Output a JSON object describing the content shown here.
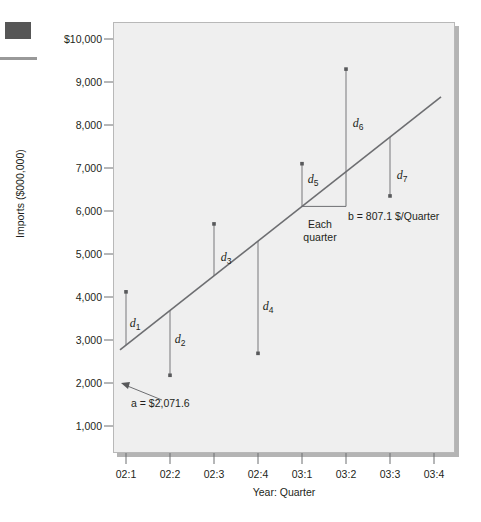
{
  "chart_data": {
    "type": "scatter",
    "title": "",
    "xlabel": "Year: Quarter",
    "ylabel": "Imports ($000,000)",
    "grid": false,
    "legend": "none",
    "categories": [
      "02:1",
      "02:2",
      "02:3",
      "02:4",
      "03:1",
      "03:2",
      "03:3",
      "03:4"
    ],
    "ytick_labels": [
      "$10,000",
      "9,000",
      "8,000",
      "7,000",
      "6,000",
      "5,000",
      "4,000",
      "3,000",
      "2,000",
      "1,000"
    ],
    "ytick_values": [
      10000,
      9000,
      8000,
      7000,
      6000,
      5000,
      4000,
      3000,
      2000,
      1000
    ],
    "ylim": [
      500,
      10500
    ],
    "xlim": [
      0.4,
      8.4
    ],
    "points": [
      {
        "x": "02:1",
        "y": 4120
      },
      {
        "x": "02:2",
        "y": 2180
      },
      {
        "x": "02:3",
        "y": 5700
      },
      {
        "x": "02:4",
        "y": 2690
      },
      {
        "x": "03:1",
        "y": 7100
      },
      {
        "x": "03:2",
        "y": 9300
      },
      {
        "x": "03:3",
        "y": 6350
      }
    ],
    "trend_line": {
      "intercept": 2071.6,
      "slope": 807.1,
      "equation": "y = 2071.6 + 807.1x"
    },
    "residual_labels": [
      "d1",
      "d2",
      "d3",
      "d4",
      "d5",
      "d6",
      "d7"
    ],
    "residual_label_display": [
      {
        "base": "d",
        "sub": "1"
      },
      {
        "base": "d",
        "sub": "2"
      },
      {
        "base": "d",
        "sub": "3"
      },
      {
        "base": "d",
        "sub": "4"
      },
      {
        "base": "d",
        "sub": "5"
      },
      {
        "base": "d",
        "sub": "6"
      },
      {
        "base": "d",
        "sub": "7"
      }
    ],
    "annotations": {
      "intercept_label": "a = $2,071.6",
      "slope_label": "b = 807.1 $/Quarter",
      "run_label_line1": "Each",
      "run_label_line2": "quarter"
    },
    "colors": {
      "plot_background": "#efefef",
      "plot_border": "#b8b8b8",
      "shadow": "#b4b4b4",
      "line": "#6d6e71",
      "point": "#58595b",
      "text": "#231f20",
      "decoration": "#565656"
    }
  },
  "ytick_positions": [
    {
      "label": "$10,000",
      "top": 39
    },
    {
      "label": "9,000",
      "top": 82
    },
    {
      "label": "8,000",
      "top": 125
    },
    {
      "label": "7,000",
      "top": 168
    },
    {
      "label": "6,000",
      "top": 211
    },
    {
      "label": "5,000",
      "top": 254
    },
    {
      "label": "4,000",
      "top": 297
    },
    {
      "label": "3,000",
      "top": 340
    },
    {
      "label": "2,000",
      "top": 383
    },
    {
      "label": "1,000",
      "top": 426
    }
  ],
  "xtick_positions": [
    {
      "label": "02:1",
      "left": 126
    },
    {
      "label": "02:2",
      "left": 170
    },
    {
      "label": "02:3",
      "left": 214
    },
    {
      "label": "02:4",
      "left": 258
    },
    {
      "label": "03:1",
      "left": 302
    },
    {
      "label": "03:2",
      "left": 346
    },
    {
      "label": "03:3",
      "left": 390
    },
    {
      "label": "03:4",
      "left": 434
    }
  ],
  "dlabel_positions": [
    {
      "base": "d",
      "sub": "1",
      "left": 135,
      "top": 324
    },
    {
      "base": "d",
      "sub": "2",
      "left": 180,
      "top": 340
    },
    {
      "base": "d",
      "sub": "3",
      "left": 226,
      "top": 258
    },
    {
      "base": "d",
      "sub": "4",
      "left": 268,
      "top": 307
    },
    {
      "base": "d",
      "sub": "5",
      "left": 313,
      "top": 180
    },
    {
      "base": "d",
      "sub": "6",
      "left": 358,
      "top": 124
    },
    {
      "base": "d",
      "sub": "7",
      "left": 402,
      "top": 176
    }
  ]
}
